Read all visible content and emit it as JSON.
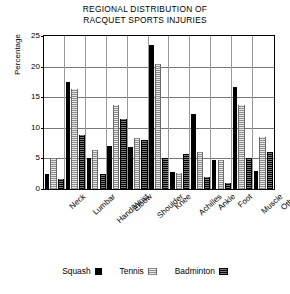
{
  "chart_data": {
    "type": "bar",
    "title": "REGIONAL DISTRIBUTION OF RACQUET SPORTS INJURIES",
    "title_lines": [
      "REGIONAL DISTRIBUTION OF",
      "RACQUET SPORTS INJURIES"
    ],
    "xlabel": "",
    "ylabel": "Percentage",
    "ylim": [
      0,
      25
    ],
    "yticks": [
      0,
      5,
      10,
      15,
      20,
      25
    ],
    "grid": true,
    "legend_position": "bottom",
    "categories": [
      "Neck",
      "Lumbar",
      "Hand/Wrist",
      "Elbow",
      "Shoulder",
      "Knee",
      "Achilles",
      "Ankle",
      "Foot",
      "Muscle",
      "Other"
    ],
    "series": [
      {
        "name": "Squash",
        "color": "#000000",
        "values": [
          2.4,
          17.5,
          5.0,
          7.0,
          6.8,
          23.5,
          2.8,
          12.2,
          4.8,
          16.7,
          3.0
        ]
      },
      {
        "name": "Tennis",
        "color": "#d2d2d2",
        "values": [
          5.0,
          16.3,
          6.3,
          13.8,
          8.3,
          20.5,
          2.6,
          6.0,
          4.8,
          13.8,
          8.5
        ]
      },
      {
        "name": "Badminton",
        "color": "#3a3a3a",
        "values": [
          1.7,
          8.8,
          2.4,
          11.5,
          8.0,
          5.0,
          5.8,
          2.0,
          1.0,
          5.0,
          6.0
        ]
      }
    ]
  },
  "legend": {
    "items": [
      {
        "label": "Squash",
        "swatch": "swatch-squash"
      },
      {
        "label": "Tennis",
        "swatch": "swatch-tennis"
      },
      {
        "label": "Badminton",
        "swatch": "swatch-badminton"
      }
    ]
  }
}
